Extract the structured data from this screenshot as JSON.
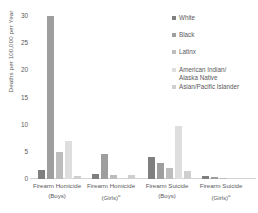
{
  "chart_data": {
    "type": "bar",
    "title": "",
    "xlabel": "",
    "ylabel": "Deaths per 100,000 per Year",
    "ylim": [
      0,
      30
    ],
    "yticks": [
      0,
      5,
      10,
      15,
      20,
      25,
      30
    ],
    "ytick_labels": [
      "0",
      "5",
      "10",
      "15",
      "20",
      "25",
      "30"
    ],
    "grid": false,
    "legend_position": "right-top",
    "categories": [
      "Firearm Homicide (Boys)",
      "Firearm Homicide (Girls)",
      "Firearm Suicide (Boys)",
      "Firearm Suicide (Girls)"
    ],
    "series": [
      {
        "name": "White",
        "color": "#7f7f7f",
        "values": [
          1.7,
          1.0,
          4.0,
          0.5
        ]
      },
      {
        "name": "Black",
        "color": "#9e9e9e",
        "values": [
          30.0,
          4.6,
          3.0,
          0.3
        ]
      },
      {
        "name": "Latinx",
        "color": "#bdbdbd",
        "values": [
          5.0,
          0.8,
          2.0,
          0.2
        ]
      },
      {
        "name": "American Indian/\nAlaska Native",
        "color": "#dedede",
        "values": [
          7.0,
          0.0,
          9.8,
          0.0
        ]
      },
      {
        "name": "Asian/Pacific Islander",
        "color": "#cfcfcf",
        "values": [
          0.6,
          0.7,
          1.5,
          0.0
        ]
      }
    ]
  },
  "axis": {
    "y_title": "Deaths per 100,000 per Year",
    "ticks": [
      "30",
      "25",
      "20",
      "15",
      "10",
      "5",
      "0"
    ]
  },
  "x_axis": {
    "groups": [
      {
        "line1": "Firearm Homicide",
        "line2": "(Boys)",
        "footnote": ""
      },
      {
        "line1": "Firearm Homicide",
        "line2": "(Girls)",
        "footnote": "a"
      },
      {
        "line1": "Firearm Suicide",
        "line2": "(Boys)",
        "footnote": ""
      },
      {
        "line1": "Firearm Suicide",
        "line2": "(Girls)",
        "footnote": "a"
      }
    ]
  },
  "legend": {
    "items": [
      {
        "label": "White",
        "color": "#7f7f7f"
      },
      {
        "label": "Black",
        "color": "#9e9e9e"
      },
      {
        "label": "Latinx",
        "color": "#bdbdbd"
      },
      {
        "label": "American Indian/\nAlaska Native",
        "color": "#dedede"
      },
      {
        "label": "Asian/Pacific Islander",
        "color": "#cfcfcf"
      }
    ]
  }
}
